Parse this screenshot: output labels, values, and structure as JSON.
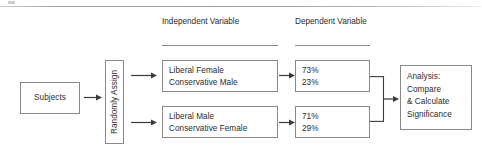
{
  "diagram": {
    "stroke_color": "#888888",
    "text_color": "#2b2b2b"
  },
  "headers": {
    "independent": {
      "line1": "Independent",
      "line2": "Variable"
    },
    "dependent": {
      "line1": "Dependent",
      "line2": "Variable"
    }
  },
  "nodes": {
    "subjects": {
      "label": "Subjects"
    },
    "randomly_assign": {
      "label": "Randomly Assign"
    },
    "treatment_1": {
      "line1": "Liberal Female",
      "line2": "Conservative Male"
    },
    "treatment_2": {
      "line1": "Liberal Male",
      "line2": "Conservative Female"
    },
    "outcome_1": {
      "line1": "73%",
      "line2": "23%"
    },
    "outcome_2": {
      "line1": "71%",
      "line2": "29%"
    },
    "analysis": {
      "line1": "Analysis:",
      "line2": "Compare",
      "line3": "& Calculate",
      "line4": "Significance"
    }
  },
  "connectors": {
    "subjects_to_assign": "arrow-right-icon",
    "assign_to_treatment_1": "arrow-right-icon",
    "assign_to_treatment_2": "arrow-right-icon",
    "treatment_1_to_outcome_1": "arrow-right-icon",
    "treatment_2_to_outcome_2": "arrow-right-icon",
    "outcomes_to_analysis": "bracket-merge-arrow-icon"
  }
}
